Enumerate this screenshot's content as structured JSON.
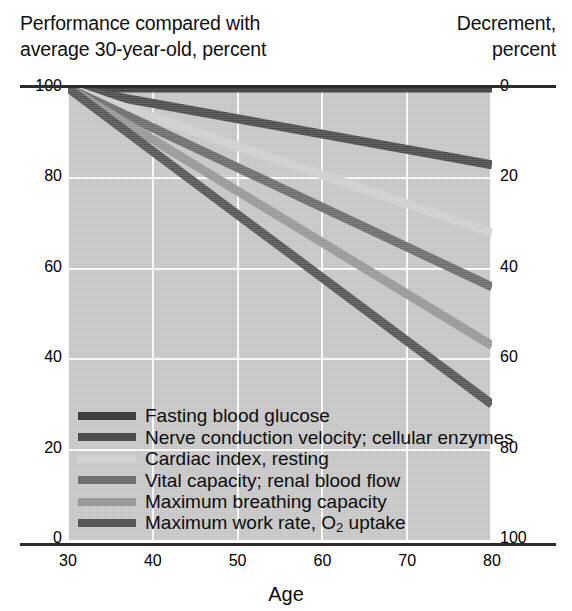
{
  "header": {
    "left_line1": "Performance compared with",
    "left_line2": "average 30-year-old, percent",
    "right_line1": "Decrement,",
    "right_line2": "percent"
  },
  "chart_data": {
    "type": "line",
    "xlabel": "Age",
    "ylabel": "Performance compared with average 30-year-old, percent",
    "y2label": "Decrement, percent",
    "xlim": [
      30,
      80
    ],
    "ylim": [
      0,
      100
    ],
    "y2lim": [
      100,
      0
    ],
    "xticks": [
      30,
      40,
      50,
      60,
      70,
      80
    ],
    "yticks": [
      0,
      20,
      40,
      60,
      80,
      100
    ],
    "y2ticks": [
      0,
      20,
      40,
      60,
      80,
      100
    ],
    "grid": true,
    "legend_position": "lower-left-inside",
    "x": [
      30,
      80
    ],
    "series": [
      {
        "name": "Fasting blood glucose",
        "values": [
          100,
          100
        ],
        "decrement_at_80": 0,
        "color": "#3f3f3f",
        "width": 9
      },
      {
        "name": "Nerve conduction velocity; cellular enzymes",
        "values": [
          100,
          83
        ],
        "decrement_at_80": 17,
        "color": "#4e4e4e",
        "width": 9
      },
      {
        "name": "Cardiac index, resting",
        "values": [
          100,
          68
        ],
        "decrement_at_80": 32,
        "color": "#d2d2d2",
        "width": 9
      },
      {
        "name": "Vital capacity; renal blood flow",
        "values": [
          100,
          56
        ],
        "decrement_at_80": 44,
        "color": "#6f6f6f",
        "width": 9
      },
      {
        "name": "Maximum breathing capacity",
        "values": [
          100,
          43
        ],
        "decrement_at_80": 57,
        "color": "#9a9a9a",
        "width": 9
      },
      {
        "name": "Maximum work rate, O2 uptake",
        "values": [
          100,
          30
        ],
        "decrement_at_80": 70,
        "color": "#585858",
        "width": 9
      }
    ]
  },
  "legend": [
    {
      "label": "Fasting blood glucose",
      "sub": ""
    },
    {
      "label": "Nerve conduction velocity; cellular enzymes",
      "sub": ""
    },
    {
      "label": "Cardiac index, resting",
      "sub": ""
    },
    {
      "label": "Vital capacity; renal blood flow",
      "sub": ""
    },
    {
      "label": "Maximum breathing capacity",
      "sub": ""
    },
    {
      "label": "Maximum work rate, O",
      "sub": "2",
      "label_tail": " uptake"
    }
  ],
  "colors": {
    "plot_background": "#c9c9c9",
    "gridline": "#fdfdfd",
    "axis_rule": "#2b2b2b",
    "text": "#0d0d0d",
    "page_background": "#ffffff"
  }
}
